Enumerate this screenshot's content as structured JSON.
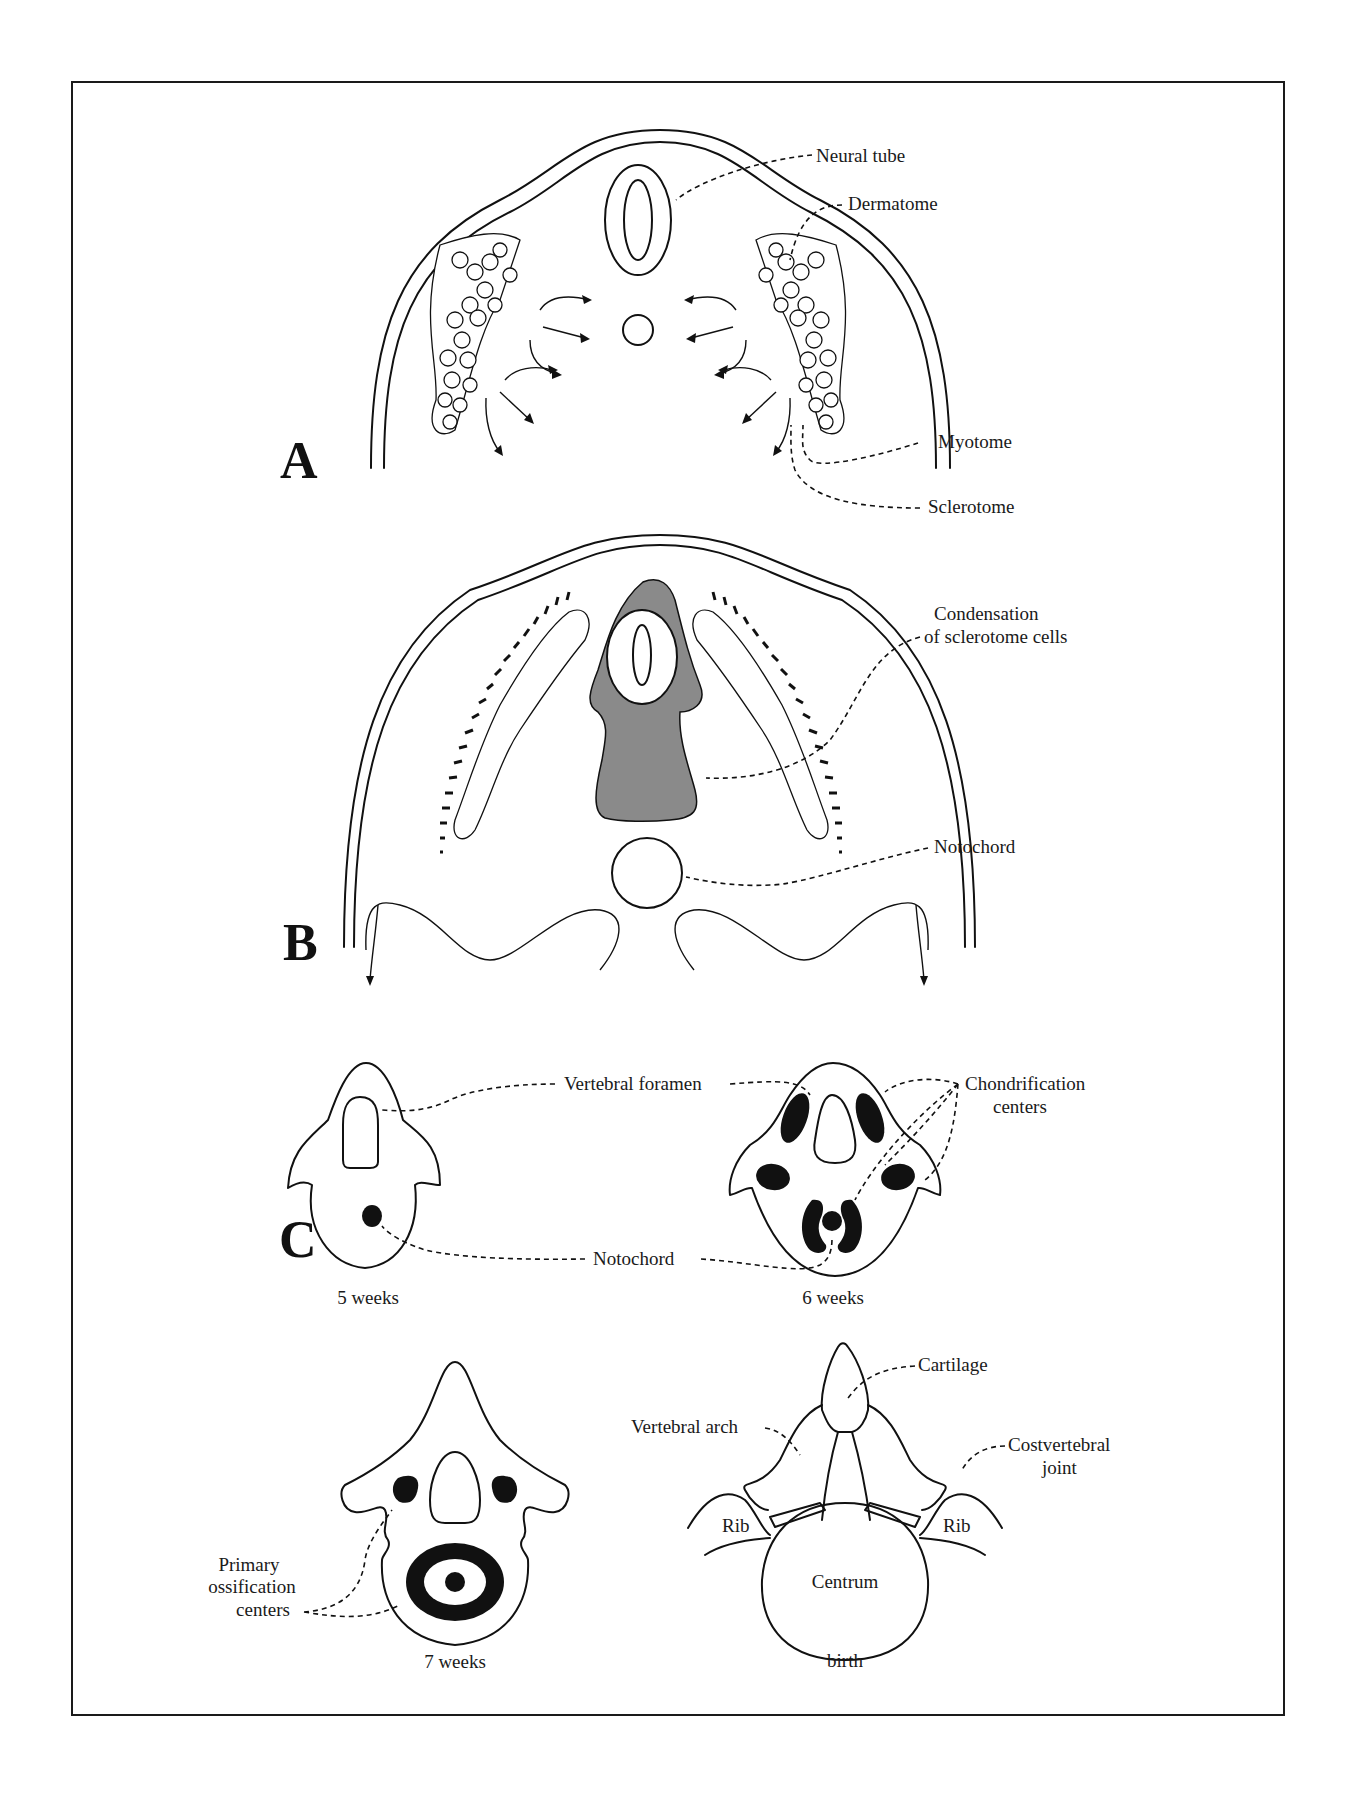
{
  "figure": {
    "panels": {
      "A": {
        "letter": "A",
        "labels": {
          "neural_tube": "Neural tube",
          "dermatome": "Dermatome",
          "myotome": "Myotome",
          "sclerotome": "Sclerotome"
        }
      },
      "B": {
        "letter": "B",
        "labels": {
          "condensation_line1": "Condensation",
          "condensation_line2": "of sclerotome cells",
          "notochord": "Notochord"
        }
      },
      "C": {
        "letter": "C",
        "labels": {
          "vertebral_foramen": "Vertebral foramen",
          "chondrification_line1": "Chondrification",
          "chondrification_line2": "centers",
          "notochord": "Notochord",
          "primary_line1": "Primary",
          "primary_line2": "ossification",
          "primary_line3": "centers",
          "cartilage": "Cartilage",
          "vertebral_arch": "Vertebral arch",
          "costvertebral_line1": "Costvertebral",
          "costvertebral_line2": "joint",
          "rib_left": "Rib",
          "rib_right": "Rib",
          "centrum": "Centrum"
        },
        "stages": {
          "week5": "5 weeks",
          "week6": "6 weeks",
          "week7": "7 weeks",
          "birth": "birth"
        }
      }
    },
    "colors": {
      "ink": "#111111",
      "condensation_gray": "#8a8a8a",
      "paper": "#ffffff"
    }
  }
}
